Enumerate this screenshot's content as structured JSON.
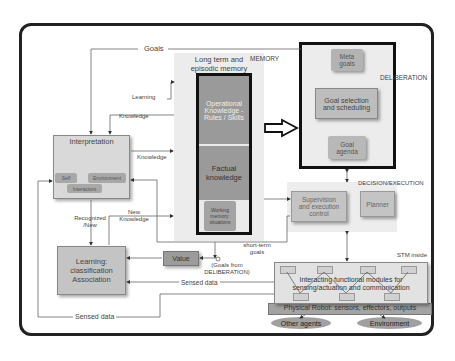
{
  "diagram": {
    "regions": {
      "memory": "MEMORY",
      "deliberation": "DELIBERATION",
      "decision_execution": "DECISION/EXECUTION",
      "stm_inside": "STM inside"
    },
    "memory": {
      "title_line1": "Long term and",
      "title_line2": "episodic memory",
      "operational_line1": "Operational",
      "operational_line2": "Knowledge -",
      "operational_line3": "Rules / Skills",
      "factual_line1": "Factual",
      "factual_line2": "knowledge",
      "working_line1": "Working",
      "working_line2": "memory:",
      "working_line3": "situations"
    },
    "deliberation": {
      "meta_line1": "Meta",
      "meta_line2": "goals",
      "goal_sel_line1": "Goal selection",
      "goal_sel_line2": "and scheduling",
      "agenda_line1": "Goal",
      "agenda_line2": "agenda"
    },
    "interpretation": {
      "title": "Interpretation",
      "self": "Self",
      "environment": "Environment",
      "interactors": "Interactors"
    },
    "learning": {
      "line1": "Learning:",
      "line2": "classification",
      "line3": "Association"
    },
    "value": "Value",
    "supervision": {
      "line1": "Supervision",
      "line2": "and execution",
      "line3": "control"
    },
    "planner": "Planner",
    "modules": {
      "line1": "Interacting functional modules for",
      "line2": "sensing/actuation and communication"
    },
    "physical_robot": "Physical Robot: sensors, effectors, outputs",
    "other_agents": "Other agents",
    "environment": "Environment",
    "labels": {
      "goals": "Goals",
      "learning": "Learning",
      "knowledge_top": "Knowledge",
      "knowledge_mid": "Knowledge",
      "recognized_line1": "Recognized",
      "recognized_line2": "/New",
      "new_knowledge_line1": "New",
      "new_knowledge_line2": "Knowledge",
      "short_term_line1": "short-term",
      "short_term_line2": "goals",
      "goals_from_line1": "(Goals from",
      "goals_from_line2": "DELIBERATION)",
      "sensed_data_inner": "Sensed data",
      "sensed_data_outer": "Sensed data"
    },
    "colors": {
      "dark_box": "#9a9a9a",
      "light_box": "#d6d6d6",
      "panel": "#ececec",
      "frame": "#222222"
    }
  }
}
